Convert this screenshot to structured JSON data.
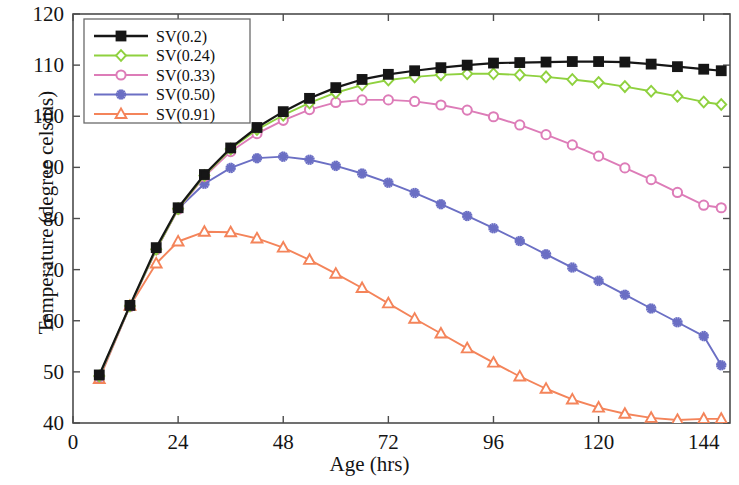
{
  "chart_data": {
    "type": "line",
    "title": "",
    "xlabel": "Age (hrs)",
    "ylabel": "Temperature (degree celsius)",
    "xlim": [
      0,
      150
    ],
    "ylim": [
      40,
      120
    ],
    "xticks": [
      0,
      24,
      48,
      72,
      96,
      120,
      144
    ],
    "yticks": [
      40,
      50,
      60,
      70,
      80,
      90,
      100,
      110,
      120
    ],
    "grid": false,
    "legend_position": "top-left",
    "series": [
      {
        "name": "SV(0.2)",
        "color": "#161616",
        "marker": "square",
        "x": [
          6,
          13,
          19,
          24,
          30,
          36,
          42,
          48,
          54,
          60,
          66,
          72,
          78,
          84,
          90,
          96,
          102,
          108,
          114,
          120,
          126,
          132,
          138,
          144,
          148
        ],
        "y": [
          49.4,
          63.0,
          74.3,
          82.1,
          88.6,
          93.8,
          97.8,
          100.9,
          103.5,
          105.6,
          107.2,
          108.2,
          108.9,
          109.5,
          110.0,
          110.4,
          110.5,
          110.6,
          110.7,
          110.7,
          110.6,
          110.2,
          109.7,
          109.2,
          108.9
        ]
      },
      {
        "name": "SV(0.24)",
        "color": "#8fd13f",
        "marker": "diamond",
        "x": [
          6,
          13,
          19,
          24,
          30,
          36,
          42,
          48,
          54,
          60,
          66,
          72,
          78,
          84,
          90,
          96,
          102,
          108,
          114,
          120,
          126,
          132,
          138,
          144,
          148
        ],
        "y": [
          49.2,
          62.9,
          74.0,
          81.9,
          88.4,
          93.6,
          97.4,
          100.2,
          102.6,
          104.6,
          106.1,
          107.1,
          107.7,
          108.1,
          108.3,
          108.3,
          108.1,
          107.7,
          107.2,
          106.6,
          105.8,
          104.9,
          103.9,
          102.8,
          102.3
        ]
      },
      {
        "name": "SV(0.33)",
        "color": "#dd7cb8",
        "marker": "circle",
        "x": [
          6,
          13,
          19,
          24,
          30,
          36,
          42,
          48,
          54,
          60,
          66,
          72,
          78,
          84,
          90,
          96,
          102,
          108,
          114,
          120,
          126,
          132,
          138,
          144,
          148
        ],
        "y": [
          49.1,
          62.8,
          73.9,
          81.8,
          88.2,
          93.1,
          96.6,
          99.2,
          101.3,
          102.7,
          103.2,
          103.2,
          102.9,
          102.2,
          101.2,
          99.9,
          98.3,
          96.4,
          94.4,
          92.2,
          89.9,
          87.6,
          85.1,
          82.6,
          82.1
        ]
      },
      {
        "name": "SV(0.50)",
        "color": "#6b6fc4",
        "marker": "star",
        "x": [
          6,
          13,
          19,
          24,
          30,
          36,
          42,
          48,
          54,
          60,
          66,
          72,
          78,
          84,
          90,
          96,
          102,
          108,
          114,
          120,
          126,
          132,
          138,
          144,
          148
        ],
        "y": [
          49.0,
          62.8,
          73.9,
          81.9,
          86.8,
          89.9,
          91.8,
          92.1,
          91.5,
          90.3,
          88.8,
          87.0,
          85.0,
          82.8,
          80.5,
          78.1,
          75.6,
          73.0,
          70.4,
          67.8,
          65.1,
          62.4,
          59.7,
          57.0,
          51.3
        ]
      },
      {
        "name": "SV(0.91)",
        "color": "#f4845a",
        "marker": "triangle",
        "x": [
          6,
          13,
          19,
          24,
          30,
          36,
          42,
          48,
          54,
          60,
          66,
          72,
          78,
          84,
          90,
          96,
          102,
          108,
          114,
          120,
          126,
          132,
          138,
          144,
          148
        ],
        "y": [
          48.6,
          62.9,
          71.2,
          75.5,
          77.4,
          77.3,
          76.1,
          74.3,
          71.9,
          69.2,
          66.4,
          63.4,
          60.4,
          57.5,
          54.6,
          51.8,
          49.1,
          46.7,
          44.6,
          43.0,
          41.8,
          41.0,
          40.6,
          40.8,
          40.8
        ]
      }
    ]
  },
  "axes": {
    "x_tick_labels": [
      "0",
      "24",
      "48",
      "72",
      "96",
      "120",
      "144"
    ],
    "y_tick_labels": [
      "40",
      "50",
      "60",
      "70",
      "80",
      "90",
      "100",
      "110",
      "120"
    ],
    "x_axis_title": "Age (hrs)",
    "y_axis_title": "Temperature (degree celsius)"
  },
  "legend": {
    "entries": [
      {
        "label": "SV(0.2)"
      },
      {
        "label": "SV(0.24)"
      },
      {
        "label": "SV(0.33)"
      },
      {
        "label": "SV(0.50)"
      },
      {
        "label": "SV(0.91)"
      }
    ]
  }
}
